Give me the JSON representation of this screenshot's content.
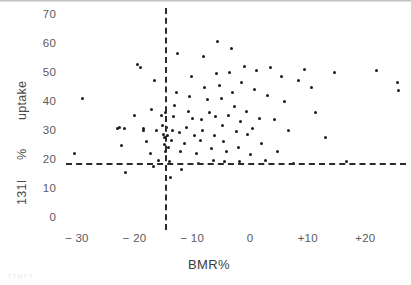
{
  "figure": {
    "axis_titles": {
      "x": "BMR%",
      "y_segments": [
        "131I",
        "%",
        "uptake"
      ]
    },
    "caption": "TTNYT"
  },
  "chart_data": {
    "type": "scatter",
    "title": "",
    "xlabel": "BMR%",
    "ylabel": "131I % uptake",
    "xlim": [
      -35,
      27
    ],
    "ylim": [
      0,
      72
    ],
    "xticks": [
      -30,
      -20,
      -10,
      0,
      10,
      20
    ],
    "xticklabels": [
      "− 30",
      "− 20",
      "− 10",
      "0",
      "+10",
      "+20"
    ],
    "yticks": [
      0,
      10,
      20,
      30,
      40,
      50,
      60,
      70
    ],
    "yticklabels": [
      "0",
      "10",
      "20",
      "30",
      "40",
      "50",
      "60",
      "70"
    ],
    "grid": false,
    "legend": null,
    "annotations": [
      {
        "type": "vline",
        "value": -14.8,
        "style": "dashed",
        "label": "BMR% reference"
      },
      {
        "type": "hline",
        "value": 18.7,
        "style": "dashed",
        "label": "131I uptake reference"
      }
    ],
    "marker": {
      "shape": "circle",
      "color": "#1b1b1b",
      "size": 3
    },
    "points": [
      {
        "x": -29.0,
        "y": 41.0
      },
      {
        "x": -30.4,
        "y": 22.0
      },
      {
        "x": -23.0,
        "y": 30.5
      },
      {
        "x": -22.6,
        "y": 31.0
      },
      {
        "x": -21.8,
        "y": 30.5
      },
      {
        "x": -22.2,
        "y": 24.5
      },
      {
        "x": -21.5,
        "y": 15.5
      },
      {
        "x": -20.0,
        "y": 35.0
      },
      {
        "x": -19.5,
        "y": 52.5
      },
      {
        "x": -19.0,
        "y": 51.5
      },
      {
        "x": -18.5,
        "y": 30.5
      },
      {
        "x": -18.4,
        "y": 30.0
      },
      {
        "x": -18.0,
        "y": 26.0
      },
      {
        "x": -17.2,
        "y": 22.0
      },
      {
        "x": -17.0,
        "y": 37.0
      },
      {
        "x": -16.5,
        "y": 47.0
      },
      {
        "x": -16.2,
        "y": 30.0
      },
      {
        "x": -16.8,
        "y": 17.5
      },
      {
        "x": -15.8,
        "y": 19.5
      },
      {
        "x": -15.4,
        "y": 35.0
      },
      {
        "x": -15.2,
        "y": 31.5
      },
      {
        "x": -15.0,
        "y": 28.5
      },
      {
        "x": -14.9,
        "y": 27.5
      },
      {
        "x": -14.8,
        "y": 25.0
      },
      {
        "x": -14.7,
        "y": 22.5
      },
      {
        "x": -14.6,
        "y": 36.0
      },
      {
        "x": -14.4,
        "y": 31.0
      },
      {
        "x": -14.3,
        "y": 28.0
      },
      {
        "x": -14.2,
        "y": 24.0
      },
      {
        "x": -14.0,
        "y": 19.0
      },
      {
        "x": -13.8,
        "y": 13.5
      },
      {
        "x": -13.6,
        "y": 26.5
      },
      {
        "x": -13.4,
        "y": 30.0
      },
      {
        "x": -13.2,
        "y": 34.5
      },
      {
        "x": -13.0,
        "y": 38.5
      },
      {
        "x": -12.8,
        "y": 43.0
      },
      {
        "x": -12.6,
        "y": 56.5
      },
      {
        "x": -12.3,
        "y": 29.0
      },
      {
        "x": -12.0,
        "y": 22.5
      },
      {
        "x": -11.8,
        "y": 16.5
      },
      {
        "x": -11.4,
        "y": 25.5
      },
      {
        "x": -11.0,
        "y": 31.0
      },
      {
        "x": -10.6,
        "y": 36.5
      },
      {
        "x": -10.4,
        "y": 41.5
      },
      {
        "x": -10.2,
        "y": 48.5
      },
      {
        "x": -10.0,
        "y": 34.0
      },
      {
        "x": -9.6,
        "y": 28.0
      },
      {
        "x": -9.2,
        "y": 22.0
      },
      {
        "x": -9.0,
        "y": 18.5
      },
      {
        "x": -8.6,
        "y": 26.5
      },
      {
        "x": -8.4,
        "y": 33.5
      },
      {
        "x": -8.2,
        "y": 30.0
      },
      {
        "x": -8.0,
        "y": 55.5
      },
      {
        "x": -7.8,
        "y": 44.5
      },
      {
        "x": -7.4,
        "y": 40.5
      },
      {
        "x": -7.0,
        "y": 36.0
      },
      {
        "x": -6.6,
        "y": 23.5
      },
      {
        "x": -6.4,
        "y": 19.5
      },
      {
        "x": -6.2,
        "y": 28.0
      },
      {
        "x": -6.0,
        "y": 34.5
      },
      {
        "x": -5.8,
        "y": 49.5
      },
      {
        "x": -5.6,
        "y": 60.5
      },
      {
        "x": -5.2,
        "y": 45.5
      },
      {
        "x": -5.0,
        "y": 41.0
      },
      {
        "x": -4.8,
        "y": 31.5
      },
      {
        "x": -4.6,
        "y": 26.0
      },
      {
        "x": -4.4,
        "y": 19.0
      },
      {
        "x": -4.0,
        "y": 22.5
      },
      {
        "x": -3.8,
        "y": 35.0
      },
      {
        "x": -3.6,
        "y": 50.0
      },
      {
        "x": -3.2,
        "y": 58.0
      },
      {
        "x": -3.0,
        "y": 43.0
      },
      {
        "x": -2.6,
        "y": 38.0
      },
      {
        "x": -2.4,
        "y": 29.5
      },
      {
        "x": -2.0,
        "y": 24.0
      },
      {
        "x": -1.8,
        "y": 19.0
      },
      {
        "x": -1.6,
        "y": 33.0
      },
      {
        "x": -1.4,
        "y": 46.5
      },
      {
        "x": -1.0,
        "y": 52.0
      },
      {
        "x": -0.6,
        "y": 36.5
      },
      {
        "x": -0.4,
        "y": 28.5
      },
      {
        "x": 0.0,
        "y": 21.5
      },
      {
        "x": 0.4,
        "y": 30.5
      },
      {
        "x": 0.8,
        "y": 44.0
      },
      {
        "x": 1.2,
        "y": 50.5
      },
      {
        "x": 1.6,
        "y": 34.0
      },
      {
        "x": 2.0,
        "y": 25.5
      },
      {
        "x": 2.6,
        "y": 19.5
      },
      {
        "x": 3.0,
        "y": 42.0
      },
      {
        "x": 3.6,
        "y": 51.5
      },
      {
        "x": 4.2,
        "y": 33.5
      },
      {
        "x": 4.8,
        "y": 22.5
      },
      {
        "x": 5.4,
        "y": 48.5
      },
      {
        "x": 6.0,
        "y": 40.0
      },
      {
        "x": 6.6,
        "y": 30.0
      },
      {
        "x": 7.6,
        "y": 18.5
      },
      {
        "x": 8.4,
        "y": 47.0
      },
      {
        "x": 9.4,
        "y": 51.0
      },
      {
        "x": 10.6,
        "y": 44.5
      },
      {
        "x": 11.4,
        "y": 36.0
      },
      {
        "x": 13.0,
        "y": 27.5
      },
      {
        "x": 14.6,
        "y": 50.0
      },
      {
        "x": 16.8,
        "y": 19.0
      },
      {
        "x": 22.0,
        "y": 50.5
      },
      {
        "x": 25.5,
        "y": 46.5
      },
      {
        "x": 25.8,
        "y": 43.5
      }
    ]
  }
}
